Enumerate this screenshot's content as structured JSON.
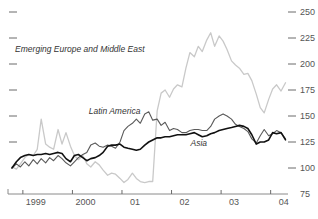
{
  "chart_data": {
    "type": "line",
    "title": "",
    "subtitle": "",
    "xlabel": "",
    "ylabel": "",
    "ylim": [
      75,
      250
    ],
    "xlim": [
      1998.7,
      2004.35
    ],
    "grid": false,
    "legend_position": "inline-annotations",
    "y_ticks": [
      250,
      225,
      200,
      175,
      150,
      125,
      100,
      75
    ],
    "y_tick_labels": [
      "250",
      "225",
      "200",
      "175",
      "150",
      "125",
      "100",
      "75"
    ],
    "y_axis_side": "right",
    "x_ticks": [
      1999,
      2000,
      2001,
      2002,
      2003,
      2004
    ],
    "x_tick_labels": [
      "1999",
      "2000",
      "01",
      "02",
      "03",
      "04"
    ],
    "left_tick_count": 6,
    "colors": {
      "emerging_europe_middle_east": "#c9c9c9",
      "latin_america": "#5a5a5a",
      "asia": "#111111",
      "axis": "#8a8a8a",
      "tick": "#6b6b6b",
      "label_text": "#555555",
      "series_label_text": "#333333",
      "background": "#ffffff"
    },
    "annotations": [
      {
        "name": "emerging-europe-label",
        "text": "Emerging Europe and Middle East",
        "x": 2000.15,
        "y": 212
      },
      {
        "name": "latin-america-label",
        "text": "Latin America",
        "x": 2000.85,
        "y": 152
      },
      {
        "name": "asia-label",
        "text": "Asia",
        "x": 2002.55,
        "y": 121
      }
    ],
    "series": [
      {
        "name": "Emerging Europe and Middle East",
        "color": "#c9c9c9",
        "width": 1.3,
        "x": [
          1998.78,
          1998.87,
          1998.95,
          1999.04,
          1999.12,
          1999.21,
          1999.29,
          1999.37,
          1999.46,
          1999.54,
          1999.62,
          1999.71,
          1999.79,
          1999.87,
          1999.96,
          2000.04,
          2000.12,
          2000.21,
          2000.29,
          2000.37,
          2000.46,
          2000.54,
          2000.62,
          2000.71,
          2000.79,
          2000.87,
          2000.96,
          2001.04,
          2001.12,
          2001.21,
          2001.29,
          2001.37,
          2001.46,
          2001.54,
          2001.62,
          2001.71,
          2001.79,
          2001.87,
          2001.96,
          2002.04,
          2002.12,
          2002.21,
          2002.29,
          2002.37,
          2002.46,
          2002.54,
          2002.62,
          2002.71,
          2002.79,
          2002.87,
          2002.96,
          2003.04,
          2003.12,
          2003.21,
          2003.29,
          2003.37,
          2003.46,
          2003.54,
          2003.62,
          2003.71,
          2003.79,
          2003.87,
          2003.96,
          2004.04,
          2004.12,
          2004.21,
          2004.3
        ],
        "y": [
          101,
          99,
          104,
          110,
          113,
          112,
          118,
          147,
          123,
          120,
          118,
          137,
          123,
          134,
          121,
          112,
          108,
          112,
          104,
          101,
          106,
          103,
          98,
          93,
          95,
          94,
          90,
          86,
          89,
          95,
          90,
          87,
          86,
          87,
          87,
          155,
          172,
          175,
          168,
          176,
          180,
          178,
          196,
          211,
          207,
          217,
          212,
          223,
          230,
          217,
          227,
          222,
          214,
          203,
          199,
          196,
          190,
          191,
          184,
          171,
          158,
          153,
          166,
          176,
          180,
          174,
          182
        ]
      },
      {
        "name": "Latin America",
        "color": "#5a5a5a",
        "width": 1.1,
        "x": [
          1998.78,
          1998.87,
          1998.95,
          1999.04,
          1999.12,
          1999.21,
          1999.29,
          1999.37,
          1999.46,
          1999.54,
          1999.62,
          1999.71,
          1999.79,
          1999.87,
          1999.96,
          2000.04,
          2000.12,
          2000.21,
          2000.29,
          2000.37,
          2000.46,
          2000.54,
          2000.62,
          2000.71,
          2000.79,
          2000.87,
          2000.96,
          2001.04,
          2001.12,
          2001.21,
          2001.29,
          2001.37,
          2001.46,
          2001.54,
          2001.62,
          2001.71,
          2001.79,
          2001.87,
          2001.96,
          2002.04,
          2002.12,
          2002.21,
          2002.29,
          2002.37,
          2002.46,
          2002.54,
          2002.62,
          2002.71,
          2002.79,
          2002.87,
          2002.96,
          2003.04,
          2003.12,
          2003.21,
          2003.29,
          2003.37,
          2003.46,
          2003.54,
          2003.62,
          2003.71,
          2003.79,
          2003.87,
          2003.96,
          2004.04,
          2004.12,
          2004.21,
          2004.3
        ],
        "y": [
          100,
          104,
          101,
          106,
          102,
          108,
          104,
          109,
          105,
          110,
          107,
          112,
          109,
          105,
          102,
          106,
          110,
          113,
          115,
          122,
          124,
          121,
          120,
          122,
          121,
          119,
          125,
          136,
          140,
          143,
          147,
          143,
          152,
          154,
          146,
          147,
          141,
          144,
          136,
          138,
          137,
          134,
          134,
          136,
          137,
          137,
          136,
          136,
          140,
          147,
          150,
          152,
          150,
          147,
          142,
          140,
          138,
          135,
          128,
          124,
          131,
          137,
          131,
          133,
          136,
          134,
          128
        ]
      },
      {
        "name": "Asia",
        "color": "#111111",
        "width": 1.6,
        "x": [
          1998.78,
          1998.87,
          1998.95,
          1999.04,
          1999.12,
          1999.21,
          1999.29,
          1999.37,
          1999.46,
          1999.54,
          1999.62,
          1999.71,
          1999.79,
          1999.87,
          1999.96,
          2000.04,
          2000.12,
          2000.21,
          2000.29,
          2000.37,
          2000.46,
          2000.54,
          2000.62,
          2000.71,
          2000.79,
          2000.87,
          2000.96,
          2001.04,
          2001.12,
          2001.21,
          2001.29,
          2001.37,
          2001.46,
          2001.54,
          2001.62,
          2001.71,
          2001.79,
          2001.87,
          2001.96,
          2002.04,
          2002.12,
          2002.21,
          2002.29,
          2002.37,
          2002.46,
          2002.54,
          2002.62,
          2002.71,
          2002.79,
          2002.87,
          2002.96,
          2003.04,
          2003.12,
          2003.21,
          2003.29,
          2003.37,
          2003.46,
          2003.54,
          2003.62,
          2003.71,
          2003.79,
          2003.87,
          2003.96,
          2004.04,
          2004.12,
          2004.21,
          2004.3
        ],
        "y": [
          100,
          106,
          110,
          112,
          113,
          112,
          113,
          113,
          114,
          113,
          114,
          115,
          114,
          109,
          106,
          112,
          113,
          110,
          107,
          109,
          110,
          112,
          115,
          121,
          122,
          122,
          123,
          120,
          119,
          118,
          117,
          118,
          122,
          125,
          127,
          129,
          129,
          130,
          130,
          131,
          132,
          132,
          132,
          133,
          134,
          132,
          130,
          131,
          133,
          134,
          136,
          137,
          138,
          139,
          140,
          141,
          140,
          138,
          132,
          123,
          125,
          125,
          127,
          134,
          133,
          134,
          127
        ]
      }
    ]
  }
}
